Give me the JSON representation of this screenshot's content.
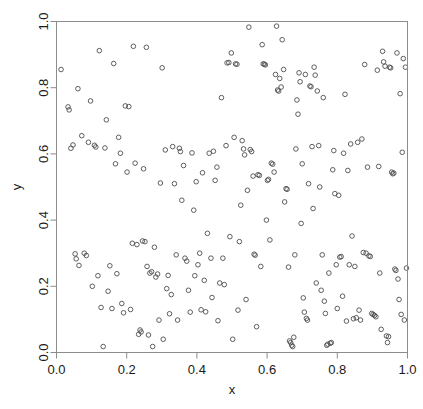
{
  "figure": {
    "title": "",
    "background_color": "#ffffff",
    "frame_color": "#8c8c8c",
    "marker_color": "#4d4d4d"
  },
  "axes": {
    "x_title": "x",
    "y_title": "y",
    "x_ticks": [
      "0.0",
      "0.2",
      "0.4",
      "0.6",
      "0.8",
      "1.0"
    ],
    "y_ticks": [
      "0.0",
      "0.2",
      "0.4",
      "0.6",
      "0.8",
      "1.0"
    ]
  },
  "chart_data": {
    "type": "scatter",
    "title": "",
    "xlabel": "x",
    "ylabel": "y",
    "xlim": [
      0,
      1
    ],
    "ylim": [
      0,
      1
    ],
    "grid": false,
    "legend": "none",
    "xticks": [
      0.0,
      0.2,
      0.4,
      0.6,
      0.8,
      1.0
    ],
    "yticks": [
      0.0,
      0.2,
      0.4,
      0.6,
      0.8,
      1.0
    ],
    "marker": "open-circle",
    "marker_size": 4.6,
    "series": [
      {
        "name": "points",
        "color": "#4d4d4d",
        "points": [
          [
            0.013,
            0.855
          ],
          [
            0.033,
            0.742
          ],
          [
            0.036,
            0.733
          ],
          [
            0.041,
            0.617
          ],
          [
            0.047,
            0.627
          ],
          [
            0.053,
            0.298
          ],
          [
            0.056,
            0.283
          ],
          [
            0.061,
            0.797
          ],
          [
            0.064,
            0.263
          ],
          [
            0.072,
            0.655
          ],
          [
            0.079,
            0.3
          ],
          [
            0.085,
            0.293
          ],
          [
            0.091,
            0.635
          ],
          [
            0.097,
            0.76
          ],
          [
            0.102,
            0.2
          ],
          [
            0.108,
            0.626
          ],
          [
            0.112,
            0.621
          ],
          [
            0.118,
            0.232
          ],
          [
            0.122,
            0.912
          ],
          [
            0.127,
            0.136
          ],
          [
            0.133,
            0.018
          ],
          [
            0.138,
            0.618
          ],
          [
            0.142,
            0.703
          ],
          [
            0.147,
            0.185
          ],
          [
            0.152,
            0.262
          ],
          [
            0.158,
            0.133
          ],
          [
            0.163,
            0.873
          ],
          [
            0.168,
            0.57
          ],
          [
            0.172,
            0.238
          ],
          [
            0.177,
            0.65
          ],
          [
            0.182,
            0.602
          ],
          [
            0.186,
            0.148
          ],
          [
            0.191,
            0.12
          ],
          [
            0.196,
            0.745
          ],
          [
            0.201,
            0.545
          ],
          [
            0.206,
            0.743
          ],
          [
            0.211,
            0.13
          ],
          [
            0.216,
            0.33
          ],
          [
            0.219,
            0.925
          ],
          [
            0.224,
            0.572
          ],
          [
            0.229,
            0.326
          ],
          [
            0.234,
            0.055
          ],
          [
            0.238,
            0.068
          ],
          [
            0.241,
            0.062
          ],
          [
            0.245,
            0.337
          ],
          [
            0.248,
            0.555
          ],
          [
            0.252,
            0.335
          ],
          [
            0.256,
            0.922
          ],
          [
            0.258,
            0.26
          ],
          [
            0.262,
            0.053
          ],
          [
            0.266,
            0.24
          ],
          [
            0.271,
            0.244
          ],
          [
            0.274,
            0.018
          ],
          [
            0.279,
            0.318
          ],
          [
            0.283,
            0.228
          ],
          [
            0.288,
            0.237
          ],
          [
            0.292,
            0.098
          ],
          [
            0.296,
            0.512
          ],
          [
            0.301,
            0.86
          ],
          [
            0.304,
            0.04
          ],
          [
            0.31,
            0.612
          ],
          [
            0.314,
            0.193
          ],
          [
            0.318,
            0.233
          ],
          [
            0.322,
            0.117
          ],
          [
            0.327,
            0.175
          ],
          [
            0.331,
            0.622
          ],
          [
            0.336,
            0.51
          ],
          [
            0.341,
            0.295
          ],
          [
            0.345,
            0.098
          ],
          [
            0.35,
            0.617
          ],
          [
            0.353,
            0.607
          ],
          [
            0.357,
            0.46
          ],
          [
            0.362,
            0.565
          ],
          [
            0.366,
            0.285
          ],
          [
            0.371,
            0.276
          ],
          [
            0.376,
            0.188
          ],
          [
            0.381,
            0.122
          ],
          [
            0.386,
            0.603
          ],
          [
            0.391,
            0.43
          ],
          [
            0.394,
            0.232
          ],
          [
            0.398,
            0.516
          ],
          [
            0.403,
            0.265
          ],
          [
            0.408,
            0.3
          ],
          [
            0.412,
            0.129
          ],
          [
            0.416,
            0.543
          ],
          [
            0.421,
            0.218
          ],
          [
            0.425,
            0.123
          ],
          [
            0.43,
            0.36
          ],
          [
            0.435,
            0.602
          ],
          [
            0.44,
            0.285
          ],
          [
            0.443,
            0.166
          ],
          [
            0.447,
            0.608
          ],
          [
            0.452,
            0.52
          ],
          [
            0.457,
            0.56
          ],
          [
            0.46,
            0.096
          ],
          [
            0.465,
            0.21
          ],
          [
            0.47,
            0.77
          ],
          [
            0.474,
            0.285
          ],
          [
            0.478,
            0.205
          ],
          [
            0.483,
            0.625
          ],
          [
            0.486,
            0.875
          ],
          [
            0.491,
            0.876
          ],
          [
            0.494,
            0.35
          ],
          [
            0.498,
            0.905
          ],
          [
            0.502,
            0.04
          ],
          [
            0.506,
            0.65
          ],
          [
            0.51,
            0.872
          ],
          [
            0.514,
            0.871
          ],
          [
            0.517,
            0.128
          ],
          [
            0.521,
            0.335
          ],
          [
            0.525,
            0.445
          ],
          [
            0.529,
            0.64
          ],
          [
            0.533,
            0.615
          ],
          [
            0.536,
            0.597
          ],
          [
            0.54,
            0.16
          ],
          [
            0.544,
            0.49
          ],
          [
            0.548,
            0.983
          ],
          [
            0.552,
            0.613
          ],
          [
            0.556,
            0.607
          ],
          [
            0.56,
            0.533
          ],
          [
            0.563,
            0.297
          ],
          [
            0.566,
            0.294
          ],
          [
            0.57,
            0.078
          ],
          [
            0.574,
            0.537
          ],
          [
            0.578,
            0.535
          ],
          [
            0.582,
            0.26
          ],
          [
            0.586,
            0.93
          ],
          [
            0.589,
            0.872
          ],
          [
            0.592,
            0.871
          ],
          [
            0.595,
            0.869
          ],
          [
            0.598,
            0.4
          ],
          [
            0.601,
            0.52
          ],
          [
            0.604,
            0.523
          ],
          [
            0.608,
            0.34
          ],
          [
            0.612,
            0.572
          ],
          [
            0.616,
            0.569
          ],
          [
            0.62,
            0.545
          ],
          [
            0.624,
            0.84
          ],
          [
            0.627,
            0.986
          ],
          [
            0.63,
            0.793
          ],
          [
            0.633,
            0.79
          ],
          [
            0.636,
            0.828
          ],
          [
            0.64,
            0.802
          ],
          [
            0.643,
            0.945
          ],
          [
            0.647,
            0.855
          ],
          [
            0.65,
            0.455
          ],
          [
            0.654,
            0.495
          ],
          [
            0.657,
            0.493
          ],
          [
            0.661,
            0.258
          ],
          [
            0.664,
            0.035
          ],
          [
            0.667,
            0.03
          ],
          [
            0.67,
            0.022
          ],
          [
            0.673,
            0.018
          ],
          [
            0.676,
            0.046
          ],
          [
            0.679,
            0.295
          ],
          [
            0.682,
            0.615
          ],
          [
            0.685,
            0.763
          ],
          [
            0.688,
            0.72
          ],
          [
            0.691,
            0.845
          ],
          [
            0.694,
            0.818
          ],
          [
            0.697,
            0.39
          ],
          [
            0.7,
            0.57
          ],
          [
            0.703,
            0.165
          ],
          [
            0.706,
            0.122
          ],
          [
            0.709,
            0.84
          ],
          [
            0.712,
            0.103
          ],
          [
            0.715,
            0.098
          ],
          [
            0.718,
            0.51
          ],
          [
            0.722,
            0.805
          ],
          [
            0.725,
            0.803
          ],
          [
            0.728,
            0.622
          ],
          [
            0.731,
            0.435
          ],
          [
            0.734,
            0.862
          ],
          [
            0.737,
            0.838
          ],
          [
            0.74,
            0.21
          ],
          [
            0.743,
            0.79
          ],
          [
            0.747,
            0.625
          ],
          [
            0.75,
            0.5
          ],
          [
            0.754,
            0.188
          ],
          [
            0.757,
            0.295
          ],
          [
            0.76,
            0.77
          ],
          [
            0.763,
            0.155
          ],
          [
            0.766,
            0.118
          ],
          [
            0.77,
            0.022
          ],
          [
            0.773,
            0.025
          ],
          [
            0.776,
            0.24
          ],
          [
            0.78,
            0.028
          ],
          [
            0.783,
            0.03
          ],
          [
            0.787,
            0.552
          ],
          [
            0.79,
            0.61
          ],
          [
            0.793,
            0.48
          ],
          [
            0.797,
            0.265
          ],
          [
            0.8,
            0.133
          ],
          [
            0.804,
            0.475
          ],
          [
            0.807,
            0.288
          ],
          [
            0.811,
            0.29
          ],
          [
            0.815,
            0.17
          ],
          [
            0.818,
            0.602
          ],
          [
            0.822,
            0.78
          ],
          [
            0.826,
            0.095
          ],
          [
            0.83,
            0.55
          ],
          [
            0.834,
            0.265
          ],
          [
            0.838,
            0.63
          ],
          [
            0.842,
            0.352
          ],
          [
            0.846,
            0.102
          ],
          [
            0.85,
            0.26
          ],
          [
            0.854,
            0.105
          ],
          [
            0.858,
            0.635
          ],
          [
            0.862,
            0.128
          ],
          [
            0.866,
            0.098
          ],
          [
            0.87,
            0.645
          ],
          [
            0.874,
            0.302
          ],
          [
            0.878,
            0.87
          ],
          [
            0.882,
            0.3
          ],
          [
            0.886,
            0.56
          ],
          [
            0.89,
            0.292
          ],
          [
            0.894,
            0.29
          ],
          [
            0.898,
            0.118
          ],
          [
            0.902,
            0.115
          ],
          [
            0.906,
            0.112
          ],
          [
            0.91,
            0.108
          ],
          [
            0.914,
            0.853
          ],
          [
            0.918,
            0.562
          ],
          [
            0.921,
            0.24
          ],
          [
            0.925,
            0.07
          ],
          [
            0.929,
            0.91
          ],
          [
            0.932,
            0.878
          ],
          [
            0.936,
            0.865
          ],
          [
            0.94,
            0.05
          ],
          [
            0.943,
            0.03
          ],
          [
            0.946,
            0.048
          ],
          [
            0.949,
            0.862
          ],
          [
            0.952,
            0.86
          ],
          [
            0.955,
            0.545
          ],
          [
            0.958,
            0.54
          ],
          [
            0.961,
            0.542
          ],
          [
            0.964,
            0.252
          ],
          [
            0.967,
            0.248
          ],
          [
            0.97,
            0.905
          ],
          [
            0.973,
            0.222
          ],
          [
            0.976,
            0.16
          ],
          [
            0.979,
            0.782
          ],
          [
            0.982,
            0.115
          ],
          [
            0.985,
            0.605
          ],
          [
            0.988,
            0.888
          ],
          [
            0.991,
            0.098
          ],
          [
            0.994,
            0.862
          ],
          [
            0.997,
            0.255
          ]
        ]
      }
    ]
  }
}
